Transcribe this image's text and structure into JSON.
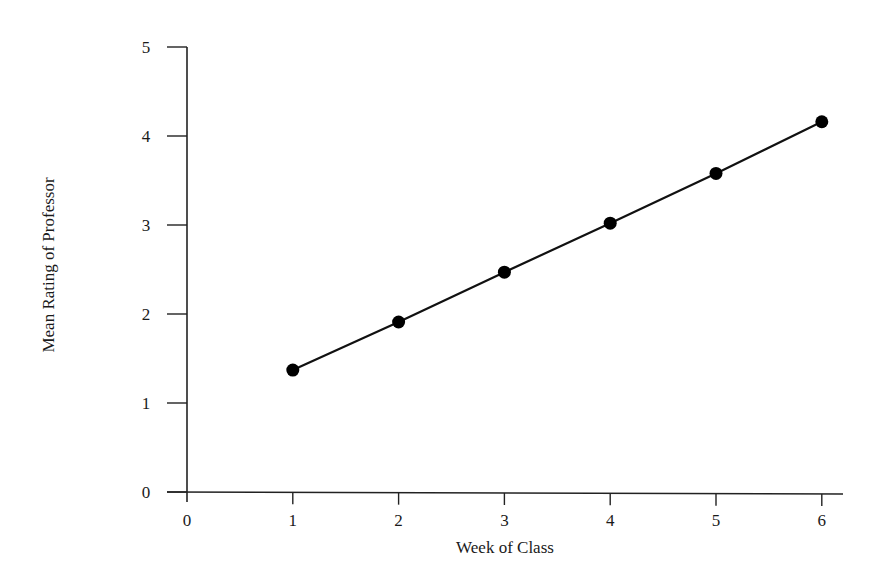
{
  "chart_data": {
    "type": "line",
    "title": "",
    "xlabel": "Week of Class",
    "ylabel": "Mean Rating of Professor",
    "x": [
      1,
      2,
      3,
      4,
      5,
      6
    ],
    "series": [
      {
        "name": "Mean Rating",
        "values": [
          1.37,
          1.91,
          2.47,
          3.02,
          3.58,
          4.16
        ],
        "markers": true
      }
    ],
    "xticks": [
      0,
      1,
      2,
      3,
      4,
      5,
      6
    ],
    "yticks": [
      0,
      1,
      2,
      3,
      4,
      5
    ],
    "xlim": [
      0,
      6.2
    ],
    "ylim": [
      0,
      5
    ],
    "grid": false,
    "legend": null,
    "colors": {
      "line": "#111111",
      "marker": "#000000",
      "axis": "#222222"
    }
  },
  "labels": {
    "xlabel": "Week of Class",
    "ylabel": "Mean Rating of Professor"
  }
}
